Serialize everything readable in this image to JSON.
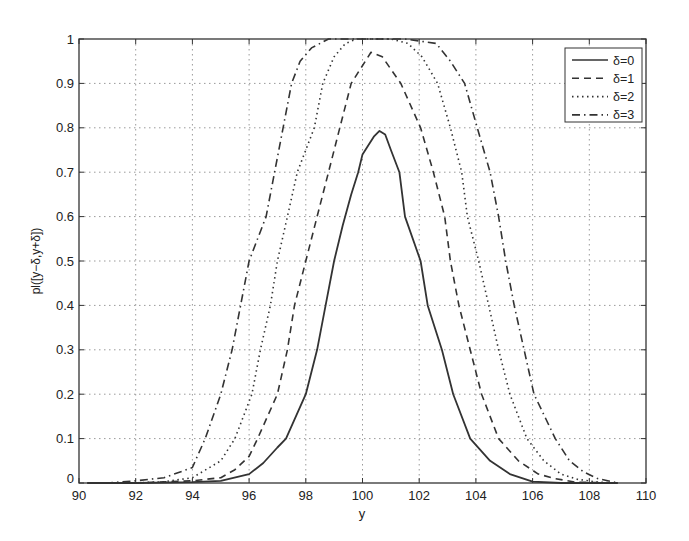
{
  "chart_data": {
    "type": "line",
    "title": "",
    "xlabel": "y",
    "ylabel": "pl([y−δ,y+δ])",
    "xlim": [
      90,
      110
    ],
    "ylim": [
      0,
      1
    ],
    "xticks": [
      90,
      92,
      94,
      96,
      98,
      100,
      102,
      104,
      106,
      108,
      110
    ],
    "yticks": [
      0,
      0.1,
      0.2,
      0.3,
      0.4,
      0.5,
      0.6,
      0.7,
      0.8,
      0.9,
      1
    ],
    "xtick_labels": [
      "90",
      "92",
      "94",
      "96",
      "98",
      "100",
      "102",
      "104",
      "106",
      "108",
      "110"
    ],
    "ytick_labels": [
      "0",
      "0.1",
      "0.2",
      "0.3",
      "0.4",
      "0.5",
      "0.6",
      "0.7",
      "0.8",
      "0.9",
      "1"
    ],
    "grid": true,
    "legend_position": "upper right",
    "series": [
      {
        "name": "δ=0",
        "style": "solid",
        "x": [
          90.3,
          92,
          94,
          95,
          96,
          96.5,
          97,
          97.3,
          98,
          98.4,
          98.7,
          99.0,
          99.3,
          99.6,
          99.85,
          100.0,
          100.2,
          100.4,
          100.6,
          100.8,
          101.0,
          101.3,
          101.5,
          102.05,
          102.3,
          102.8,
          103.2,
          103.8,
          104.5,
          105.2,
          106,
          107,
          108,
          109
        ],
        "values": [
          0,
          0,
          0.002,
          0.005,
          0.02,
          0.045,
          0.08,
          0.1,
          0.2,
          0.3,
          0.4,
          0.5,
          0.58,
          0.65,
          0.7,
          0.74,
          0.76,
          0.78,
          0.793,
          0.785,
          0.75,
          0.7,
          0.6,
          0.5,
          0.4,
          0.3,
          0.2,
          0.1,
          0.05,
          0.02,
          0.003,
          0,
          0,
          0
        ]
      },
      {
        "name": "δ=1",
        "style": "dashed",
        "x": [
          90.3,
          92,
          94,
          95,
          95.5,
          96,
          96.3,
          97.0,
          97.35,
          97.6,
          98.0,
          98.4,
          98.8,
          99.2,
          99.6,
          100.1,
          100.3,
          100.7,
          101.35,
          102.05,
          102.5,
          102.9,
          103.1,
          103.4,
          103.8,
          104.2,
          104.8,
          105.5,
          106.2,
          106.8,
          107.5,
          109
        ],
        "values": [
          0,
          0,
          0.005,
          0.012,
          0.03,
          0.06,
          0.1,
          0.2,
          0.3,
          0.4,
          0.5,
          0.6,
          0.7,
          0.8,
          0.9,
          0.95,
          0.97,
          0.96,
          0.9,
          0.8,
          0.7,
          0.6,
          0.5,
          0.4,
          0.3,
          0.2,
          0.1,
          0.05,
          0.02,
          0.01,
          0.002,
          0
        ]
      },
      {
        "name": "δ=2",
        "style": "dotted",
        "x": [
          90.3,
          92,
          93,
          94,
          95,
          95.5,
          96.1,
          96.4,
          96.75,
          97.0,
          97.35,
          97.7,
          98.0,
          98.3,
          98.6,
          99.0,
          99.4,
          99.8,
          100.5,
          101.0,
          101.6,
          102.1,
          102.65,
          103.1,
          103.5,
          103.7,
          104.1,
          104.45,
          104.8,
          105.2,
          105.8,
          106.4,
          107.0,
          107.6,
          108.3,
          109
        ],
        "values": [
          0,
          0,
          0.003,
          0.012,
          0.05,
          0.1,
          0.2,
          0.3,
          0.4,
          0.5,
          0.6,
          0.7,
          0.75,
          0.8,
          0.9,
          0.96,
          0.99,
          1,
          1,
          1,
          0.99,
          0.96,
          0.9,
          0.8,
          0.7,
          0.6,
          0.5,
          0.4,
          0.3,
          0.2,
          0.1,
          0.05,
          0.02,
          0.008,
          0.002,
          0
        ]
      },
      {
        "name": "δ=3",
        "style": "dash-dot",
        "x": [
          90.3,
          91,
          92,
          93,
          94,
          94.45,
          95.0,
          95.4,
          95.7,
          96.0,
          96.3,
          96.6,
          96.9,
          97.2,
          97.5,
          97.8,
          98.2,
          98.8,
          99.5,
          100.5,
          101.5,
          102.6,
          103.1,
          103.6,
          104.05,
          104.5,
          104.8,
          105.05,
          105.35,
          105.7,
          106.05,
          106.8,
          107.3,
          107.8,
          108.3,
          108.8,
          109
        ],
        "values": [
          0,
          0,
          0.005,
          0.012,
          0.035,
          0.1,
          0.2,
          0.3,
          0.4,
          0.5,
          0.55,
          0.6,
          0.7,
          0.8,
          0.9,
          0.95,
          0.98,
          1,
          1,
          1,
          1,
          0.99,
          0.95,
          0.9,
          0.8,
          0.7,
          0.6,
          0.5,
          0.4,
          0.3,
          0.2,
          0.1,
          0.05,
          0.025,
          0.01,
          0.003,
          0
        ]
      }
    ]
  },
  "legend": {
    "items": [
      {
        "label": "δ=0",
        "style": "solid"
      },
      {
        "label": "δ=1",
        "style": "dashed"
      },
      {
        "label": "δ=2",
        "style": "dotted"
      },
      {
        "label": "δ=3",
        "style": "dash-dot"
      }
    ]
  },
  "colors": {
    "line": "#333333",
    "axis": "#333333",
    "grid": "#9a9a9a",
    "background": "#ffffff"
  }
}
